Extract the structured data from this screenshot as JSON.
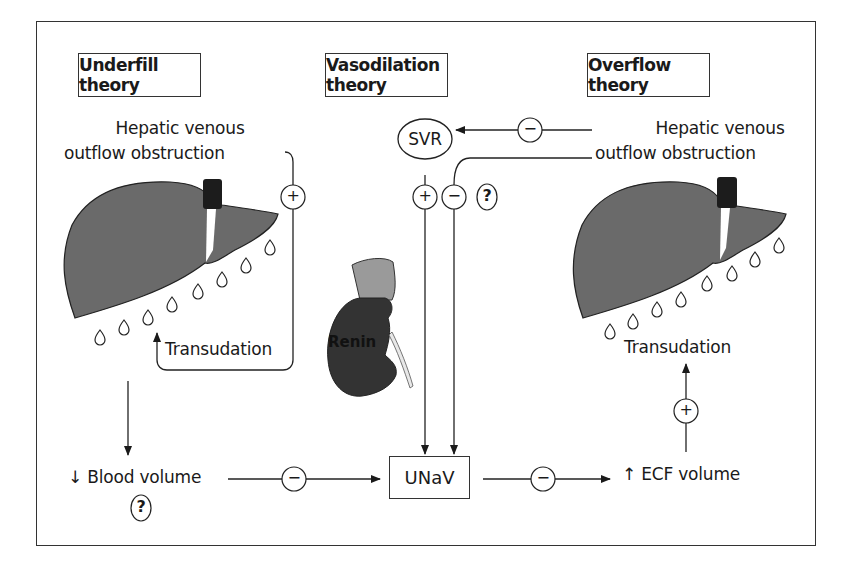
{
  "headers": {
    "underfill": "Underfill theory",
    "vasodilation": "Vasodilation theory",
    "overflow": "Overflow theory"
  },
  "left": {
    "cause_line1": "Hepatic venous",
    "cause_line2": "outflow obstruction",
    "transudation": "Transudation",
    "blood_volume": "↓ Blood volume",
    "question": "?",
    "feedback_sign": "+"
  },
  "center": {
    "svr": "SVR",
    "renin": "Renin",
    "unav": "UNaV",
    "svr_sign": "−",
    "svr_to_unav_sign": "+",
    "obstruction_to_unav_sign": "−",
    "question": "?"
  },
  "right": {
    "cause_line1": "Hepatic venous",
    "cause_line2": "outflow obstruction",
    "transudation": "Transudation",
    "ecf_volume": "↑ ECF volume",
    "ecf_sign": "+"
  },
  "bottom": {
    "blood_to_unav_sign": "−",
    "unav_to_ecf_sign": "−"
  },
  "colors": {
    "liver": "#6a6a6a",
    "vein": "#1c1c1c",
    "kidney": "#333333",
    "adrenal": "#9a9a9a"
  }
}
